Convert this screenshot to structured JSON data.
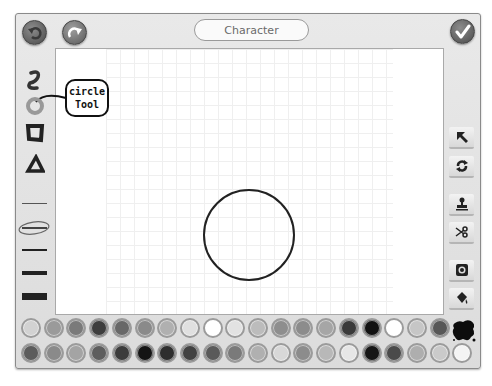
{
  "header": {
    "title": "Character",
    "undo_icon": "undo-icon",
    "redo_icon": "redo-icon",
    "done_icon": "checkmark-icon"
  },
  "left_toolbar": {
    "tools": [
      {
        "name": "freehand",
        "icon": "squiggle-icon"
      },
      {
        "name": "circle",
        "icon": "circle-tool-icon",
        "selected": true
      },
      {
        "name": "rectangle",
        "icon": "square-tool-icon"
      },
      {
        "name": "triangle",
        "icon": "triangle-tool-icon"
      }
    ],
    "line_widths": [
      1,
      2,
      3,
      5,
      8
    ],
    "selected_line_width_index": 1
  },
  "callout": {
    "line1": "circle",
    "line2": "Tool"
  },
  "right_toolbar": {
    "buttons": [
      {
        "name": "select",
        "icon": "arrow-pointer-icon"
      },
      {
        "name": "rotate",
        "icon": "rotate-icon"
      },
      {
        "name": "stamp",
        "icon": "stamp-icon"
      },
      {
        "name": "cut",
        "icon": "scissors-icon"
      },
      {
        "name": "camera",
        "icon": "camera-icon"
      },
      {
        "name": "fill",
        "icon": "paint-bucket-icon"
      }
    ]
  },
  "canvas": {
    "shapes": [
      {
        "type": "circle",
        "cx": 249,
        "cy": 235,
        "r": 45,
        "stroke": "#222222"
      }
    ]
  },
  "palette": {
    "row1": [
      "#d2d2d2",
      "#9a9a9a",
      "#7a7a7a",
      "#3e3e3e",
      "#686868",
      "#8a8a8a",
      "#b0b0b0",
      "#e0e0e0",
      "#ffffff",
      "#e2e2e2",
      "#bcbcbc",
      "#8e8e8e",
      "#8c8c8c",
      "#a6a6a6",
      "#3a3a3a",
      "#111111",
      "#ffffff",
      "#c6c6c6",
      "#575757"
    ],
    "row2": [
      "#5c5c5c",
      "#8a8a8a",
      "#a4a4a4",
      "#5e5e5e",
      "#3c3c3c",
      "#141414",
      "#2e2e2e",
      "#424242",
      "#5a5a5a",
      "#7a7a7a",
      "#b0b0b0",
      "#d8d8d8",
      "#8c8c8c",
      "#b8b8b8",
      "#e6e6e6",
      "#161616",
      "#4a4a4a",
      "#aeaeae",
      "#cacaca",
      "#f4f4f4"
    ],
    "paint_blot_icon": "ink-blot-icon"
  }
}
